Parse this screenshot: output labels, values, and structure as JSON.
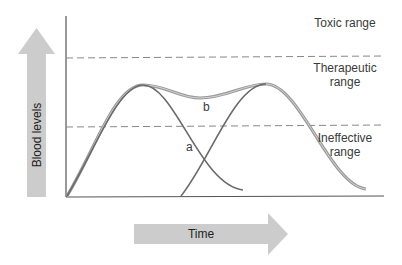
{
  "diagram": {
    "y_axis_label": "Blood levels",
    "x_axis_label": "Time",
    "ranges": [
      {
        "name": "toxic",
        "label_lines": [
          "Toxic range"
        ]
      },
      {
        "name": "therapeutic",
        "label_lines": [
          "Therapeutic",
          "range"
        ]
      },
      {
        "name": "ineffective",
        "label_lines": [
          "Ineffective",
          "range"
        ]
      }
    ],
    "curves": [
      {
        "id": "a",
        "label": "a",
        "description": "single dose curve; rises, peaks in therapeutic range, falls below"
      },
      {
        "id": "b",
        "label": "b",
        "description": "repeated dose combined curve; stays within therapeutic range"
      }
    ],
    "colors": {
      "arrow_fill": "#cccccc",
      "axis": "#555555",
      "dashed": "#888888",
      "curve_a": "#666666",
      "curve_b": "#999999"
    }
  }
}
